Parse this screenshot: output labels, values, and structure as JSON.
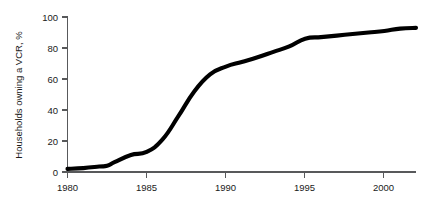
{
  "chart_data": {
    "type": "line",
    "title": "",
    "subtitle": "",
    "xlabel": "",
    "ylabel": "Households owning a VCR, %",
    "xlim": [
      1980,
      2002
    ],
    "ylim": [
      0,
      100
    ],
    "grid": false,
    "legend": "none",
    "x_ticks": [
      "1980",
      "1985",
      "1990",
      "1995",
      "2000"
    ],
    "x_tick_values": [
      1980,
      1985,
      1990,
      1995,
      2000
    ],
    "y_ticks": [
      "0",
      "20",
      "40",
      "60",
      "80",
      "100"
    ],
    "y_tick_values": [
      0,
      20,
      40,
      60,
      80,
      100
    ],
    "series": [
      {
        "name": "Households owning a VCR",
        "color": "#000000",
        "x": [
          1980,
          1981,
          1982,
          1982.5,
          1983,
          1984,
          1985,
          1986,
          1987,
          1988,
          1989,
          1990,
          1991,
          1992,
          1993,
          1994,
          1995,
          1996,
          1997,
          1998,
          1999,
          2000,
          2001,
          2002
        ],
        "values": [
          2,
          2.5,
          3.5,
          4,
          6.5,
          11,
          13,
          21,
          36,
          52,
          63,
          68,
          71,
          74,
          77.5,
          81,
          86,
          87,
          88,
          89,
          90,
          91,
          92.5,
          93
        ]
      }
    ],
    "annotations": [
      "Flat near 2% from 1980 to 1982",
      "Steep adoption phase 1984 to 1989",
      "Knee of curve at 1989 near 63%",
      "Step up between 1994 and 1995 from 81% to 86%",
      "Plateau approaching 93% by 2002"
    ]
  },
  "colors": {
    "background": "#ffffff",
    "curve": "#000000",
    "axis": "#58595b",
    "text": "#1a1a1a"
  }
}
